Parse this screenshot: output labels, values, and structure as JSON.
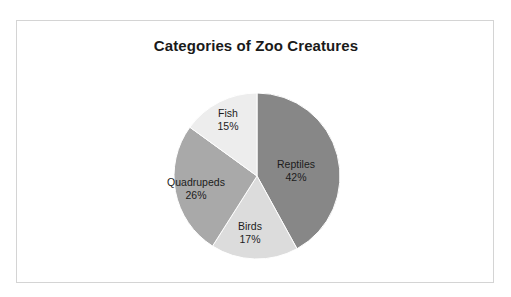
{
  "frame": {
    "border_color": "#d4d4d4",
    "background": "#ffffff"
  },
  "chart_data": {
    "type": "pie",
    "title": "Categories of Zoo Creatures",
    "categories": [
      "Reptiles",
      "Birds",
      "Quadrupeds",
      "Fish"
    ],
    "values": [
      42,
      17,
      26,
      15
    ],
    "value_unit": "%",
    "start_angle_deg": 0,
    "direction": "clockwise",
    "legend": "none",
    "labels_position": "inside-outside-mixed",
    "slices": [
      {
        "name": "Reptiles",
        "value": 42,
        "label": "Reptiles",
        "value_label": "42%",
        "color": "#878787"
      },
      {
        "name": "Birds",
        "value": 17,
        "label": "Birds",
        "value_label": "17%",
        "color": "#dcdcdc"
      },
      {
        "name": "Quadrupeds",
        "value": 26,
        "label": "Quadrupeds",
        "value_label": "26%",
        "color": "#a9a9a9"
      },
      {
        "name": "Fish",
        "value": 15,
        "label": "Fish",
        "value_label": "15%",
        "color": "#ededed"
      }
    ],
    "title_color": "#1a1a1a",
    "label_color": "#1c1c1c",
    "xlabel": "",
    "ylabel": ""
  }
}
